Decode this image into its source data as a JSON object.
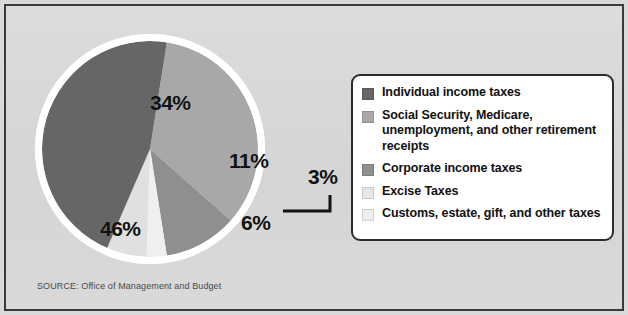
{
  "chart_data": {
    "type": "pie",
    "title": "",
    "subtitle": "",
    "xlabel": "",
    "ylabel": "",
    "legend_position": "right",
    "grid": false,
    "units": "percent",
    "categories": [
      "Individual income taxes",
      "Social Security, Medicare, unemployment, and other retirement receipts",
      "Corporate income taxes",
      "Excise Taxes",
      "Customs, estate, gift, and other taxes"
    ],
    "values": [
      46,
      34,
      11,
      3,
      6
    ],
    "slices": [
      {
        "label": "Individual income taxes",
        "value": 46,
        "data_label": "46%",
        "color": "#666666"
      },
      {
        "label": "Social Security, Medicare, unemployment, and other retirement receipts",
        "value": 34,
        "data_label": "34%",
        "color": "#a8a8a8"
      },
      {
        "label": "Corporate income taxes",
        "value": 11,
        "data_label": "11%",
        "color": "#8f8f8f"
      },
      {
        "label": "Excise Taxes",
        "value": 3,
        "data_label": "3%",
        "color": "#efefef"
      },
      {
        "label": "Customs, estate, gift, and other taxes",
        "value": 6,
        "data_label": "6%",
        "color": "#e0e0e0"
      }
    ],
    "data_labels": [
      "34%",
      "11%",
      "3%",
      "6%",
      "46%"
    ],
    "source": "SOURCE: Office of Management and Budget"
  },
  "pie": {
    "labels": {
      "p34": "34%",
      "p11": "11%",
      "p46": "46%",
      "p6": "6%",
      "p3": "3%"
    }
  },
  "legend": {
    "items": [
      {
        "label": "Individual income taxes",
        "color": "#666666"
      },
      {
        "label": "Social Security, Medicare, unemployment, and other retirement receipts",
        "color": "#a8a8a8"
      },
      {
        "label": "Corporate income taxes",
        "color": "#8f8f8f"
      },
      {
        "label": "Excise Taxes",
        "color": "#e6e6e6"
      },
      {
        "label": "Customs, estate, gift, and other taxes",
        "color": "#ededed"
      }
    ]
  },
  "footer": {
    "source": "SOURCE: Office of Management and Budget"
  },
  "colors": {
    "background": "#d9d9d9",
    "frame_border": "#3a3a3a",
    "legend_background": "#ffffff",
    "legend_border": "#2c2c2c",
    "text": "#111111",
    "source_text": "#4a4a4a",
    "pie_ring": "#ffffff"
  }
}
